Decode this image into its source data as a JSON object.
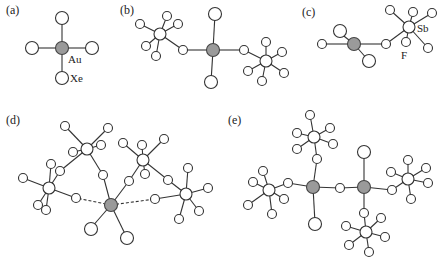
{
  "figure": {
    "panels": [
      {
        "id": "a",
        "label": "(a)",
        "atom_labels": [
          "Au",
          "Xe"
        ]
      },
      {
        "id": "b",
        "label": "(b)",
        "atom_labels": []
      },
      {
        "id": "c",
        "label": "(c)",
        "atom_labels": [
          "Sb",
          "F"
        ]
      },
      {
        "id": "d",
        "label": "(d)",
        "atom_labels": []
      },
      {
        "id": "e",
        "label": "(e)",
        "atom_labels": []
      }
    ],
    "legend": {
      "gold": "Au",
      "xenon": "Xe",
      "antimony": "Sb",
      "fluorine": "F"
    },
    "colors": {
      "gold_fill": "#9a9a9a",
      "atom_fill": "#ffffff",
      "stroke": "#333333"
    }
  }
}
